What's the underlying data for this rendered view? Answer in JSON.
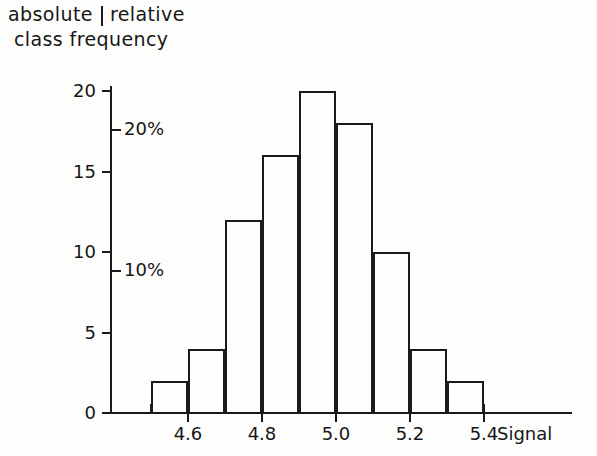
{
  "title": {
    "left": "absolute",
    "separator": "|",
    "right": "relative",
    "line2": "class frequency"
  },
  "axis_label_x": "Signal",
  "chart_data": {
    "type": "bar",
    "subtitle": "",
    "xlabel": "Signal",
    "ylabel": "absolute class frequency",
    "ylabel_secondary": "relative class frequency",
    "grid": false,
    "legend": "none",
    "bin_width": 0.1,
    "bin_edges": [
      4.5,
      4.6,
      4.7,
      4.8,
      4.9,
      5.0,
      5.1,
      5.2,
      5.3,
      5.4
    ],
    "categories": [
      "4.5-4.6",
      "4.6-4.7",
      "4.7-4.8",
      "4.8-4.9",
      "4.9-5.0",
      "5.0-5.1",
      "5.1-5.2",
      "5.2-5.3",
      "5.3-5.4"
    ],
    "values": [
      2,
      4,
      12,
      16,
      20,
      18,
      10,
      4,
      2
    ],
    "total_count": 88,
    "xlim": [
      4.4,
      5.6
    ],
    "ylim": [
      0,
      21
    ],
    "xticks": [
      4.6,
      4.8,
      5.0,
      5.2,
      5.4
    ],
    "xticklabels": [
      "4.6",
      "4.8",
      "5.0",
      "5.2",
      "5.4"
    ],
    "yticks": [
      0,
      5,
      10,
      15,
      20
    ],
    "yticklabels": [
      "0",
      "5",
      "10",
      "15",
      "20"
    ],
    "secondary_yticks_percent": [
      10,
      20
    ],
    "secondary_yticklabels": [
      "10%",
      "20%"
    ],
    "secondary_axis_note": "relative frequency, 10% corresponds to 8.8 counts"
  },
  "y_axis": {
    "ticks": [
      {
        "label": "20",
        "value": 20
      },
      {
        "label": "15",
        "value": 15
      },
      {
        "label": "10",
        "value": 10
      },
      {
        "label": "5",
        "value": 5
      },
      {
        "label": "0",
        "value": 0
      }
    ]
  },
  "percent_axis": {
    "ticks": [
      {
        "label": "20%",
        "value": 20
      },
      {
        "label": "10%",
        "value": 10
      }
    ]
  },
  "x_axis": {
    "ticks": [
      {
        "label": "4.6",
        "value": 4.6
      },
      {
        "label": "4.8",
        "value": 4.8
      },
      {
        "label": "5.0",
        "value": 5.0
      },
      {
        "label": "5.2",
        "value": 5.2
      },
      {
        "label": "5.4",
        "value": 5.4
      }
    ]
  }
}
